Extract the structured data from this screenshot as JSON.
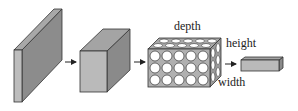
{
  "diagram": {
    "type": "flow",
    "labels": {
      "depth": "depth",
      "height": "height",
      "width": "width"
    },
    "colors": {
      "front_face": "#b8b8b8",
      "side_face": "#8a8a8a",
      "top_face": "#a4a4a4",
      "outline": "#333333",
      "neuron_fill": "#ffffff",
      "arrow": "#222222"
    },
    "grid": {
      "front_rows": 3,
      "front_cols": 5,
      "top_rows": 2,
      "side_cols": 2
    }
  }
}
